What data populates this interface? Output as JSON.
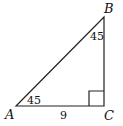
{
  "diagram": {
    "type": "right-triangle",
    "vertices": {
      "A": {
        "label": "A",
        "x": 16,
        "y": 106
      },
      "B": {
        "label": "B",
        "x": 104,
        "y": 17
      },
      "C": {
        "label": "C",
        "x": 104,
        "y": 106
      }
    },
    "angles": {
      "A": "45",
      "B": "45",
      "C": "right-angle"
    },
    "sides": {
      "AC": "9"
    },
    "colors": {
      "line": "#222222",
      "text": "#111111",
      "background": "#ffffff"
    }
  }
}
